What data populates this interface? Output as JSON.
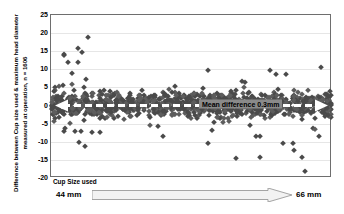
{
  "chart_data": {
    "type": "scatter",
    "title": "",
    "xlabel": "Cup Size used",
    "ylabel": "Difference between Cup size used & maximum head diameter measured at operation, n = 1606",
    "ylim": [
      -20,
      25
    ],
    "yticks": [
      25,
      20,
      15,
      10,
      5,
      0,
      -5,
      -10,
      -15,
      -20
    ],
    "ytick_labels": [
      "25",
      "20",
      "15",
      "10",
      "5",
      "0",
      "-5",
      "-10",
      "-15",
      "-20"
    ],
    "grid": true,
    "legend": "none",
    "n": 1606,
    "x_range_label_left": "44 mm",
    "x_range_label_right": "66  mm",
    "annotation": "Mean difference 0.3mm",
    "mean_value": 0.3,
    "marker": "diamond",
    "marker_color": "#4a4a4a",
    "notable_outliers": [
      {
        "x": 0.13,
        "y": 18.9
      },
      {
        "x": 0.11,
        "y": 14.8
      },
      {
        "x": 0.095,
        "y": 15.8
      },
      {
        "x": 0.045,
        "y": 14.3
      },
      {
        "x": 0.045,
        "y": 14.0
      },
      {
        "x": 0.06,
        "y": 11.9
      },
      {
        "x": 0.095,
        "y": 11.9
      },
      {
        "x": 0.075,
        "y": 8.9
      },
      {
        "x": 0.56,
        "y": 9.9
      },
      {
        "x": 0.78,
        "y": 9.9
      },
      {
        "x": 0.8,
        "y": 8.8
      },
      {
        "x": 0.835,
        "y": 8.8
      },
      {
        "x": 0.96,
        "y": 10.7
      },
      {
        "x": 0.68,
        "y": 6.9
      },
      {
        "x": 0.69,
        "y": 6.6
      },
      {
        "x": 0.1,
        "y": -10.1
      },
      {
        "x": 0.12,
        "y": -11.2
      },
      {
        "x": 0.56,
        "y": -10.2
      },
      {
        "x": 0.66,
        "y": -14.4
      },
      {
        "x": 0.745,
        "y": -14.3
      },
      {
        "x": 0.895,
        "y": -14.3
      },
      {
        "x": 0.905,
        "y": -18.2
      },
      {
        "x": 0.045,
        "y": -7.1
      },
      {
        "x": 0.05,
        "y": -6.3
      },
      {
        "x": 0.145,
        "y": -7.2
      },
      {
        "x": 0.175,
        "y": -7.2
      },
      {
        "x": 0.085,
        "y": -7.1
      },
      {
        "x": 0.105,
        "y": -7.1
      },
      {
        "x": 0.4,
        "y": -8.3
      },
      {
        "x": 0.825,
        "y": -10.2
      },
      {
        "x": 0.86,
        "y": -10.2
      },
      {
        "x": 0.865,
        "y": -12.3
      },
      {
        "x": 0.955,
        "y": -8.3
      },
      {
        "x": 0.73,
        "y": -8.4
      },
      {
        "x": 0.745,
        "y": -8.4
      }
    ]
  },
  "bottom_axis": {
    "label": "Cup Size used",
    "left": "44 mm",
    "right": "66  mm",
    "arrow_icon": "right-arrow-icon"
  }
}
